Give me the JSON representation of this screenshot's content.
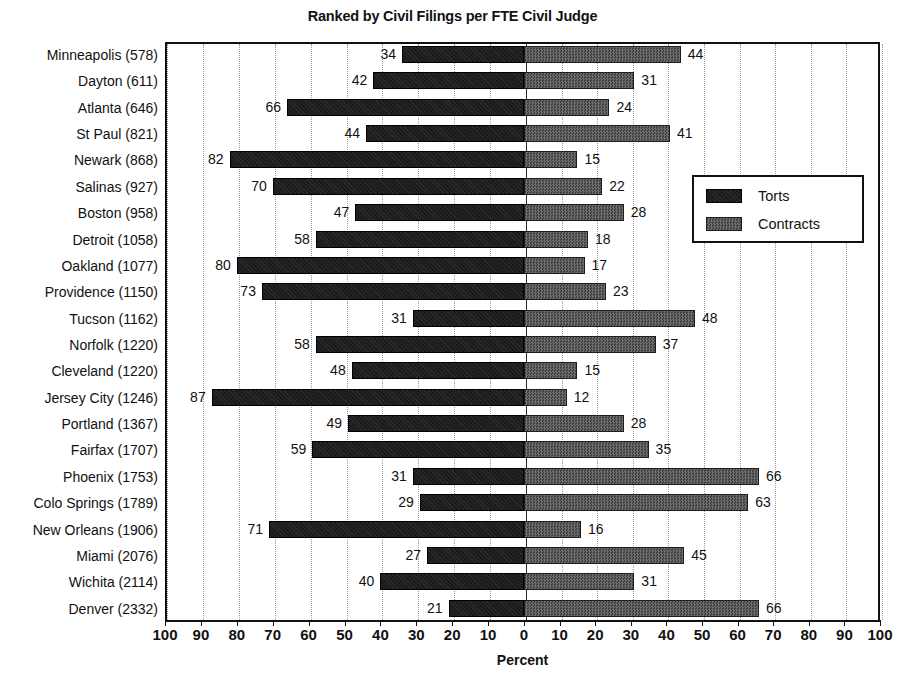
{
  "chart_data": {
    "type": "bar",
    "subtype": "diverging-horizontal-bar",
    "title": "Ranked by Civil Filings per FTE Civil Judge",
    "xlabel": "Percent",
    "ylabel": "",
    "xlim": [
      -100,
      100
    ],
    "xticks": [
      100,
      90,
      80,
      70,
      60,
      50,
      40,
      30,
      20,
      10,
      0,
      10,
      20,
      30,
      40,
      50,
      60,
      70,
      80,
      90,
      100
    ],
    "grid": "vertical-dotted",
    "legend_position": "center-right",
    "categories": [
      "Minneapolis (578)",
      "Dayton (611)",
      "Atlanta (646)",
      "St Paul (821)",
      "Newark (868)",
      "Salinas (927)",
      "Boston (958)",
      "Detroit (1058)",
      "Oakland (1077)",
      "Providence (1150)",
      "Tucson (1162)",
      "Norfolk (1220)",
      "Cleveland (1220)",
      "Jersey City (1246)",
      "Portland (1367)",
      "Fairfax (1707)",
      "Phoenix (1753)",
      "Colo Springs (1789)",
      "New Orleans (1906)",
      "Miami (2076)",
      "Wichita (2114)",
      "Denver (2332)"
    ],
    "series": [
      {
        "name": "Torts",
        "direction": "left",
        "color": "#1b1b1b",
        "values": [
          34,
          42,
          66,
          44,
          82,
          70,
          47,
          58,
          80,
          73,
          31,
          58,
          48,
          87,
          49,
          59,
          31,
          29,
          71,
          27,
          40,
          21
        ]
      },
      {
        "name": "Contracts",
        "direction": "right",
        "color": "#5a5a5a",
        "values": [
          44,
          31,
          24,
          41,
          15,
          22,
          28,
          18,
          17,
          23,
          48,
          37,
          15,
          12,
          28,
          35,
          66,
          63,
          16,
          45,
          31,
          66
        ]
      }
    ]
  },
  "legend": {
    "items": [
      {
        "label": "Torts",
        "swatch": "torts-swatch"
      },
      {
        "label": "Contracts",
        "swatch": "contracts-swatch"
      }
    ]
  }
}
